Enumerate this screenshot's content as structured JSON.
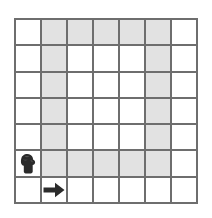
{
  "puzzle": {
    "name": "grid-path-puzzle",
    "grid": {
      "rows": 7,
      "columns": 7,
      "line_color": "#6e6e6e",
      "cell_background": "#ffffff",
      "shaded_color": "#e2e2e2",
      "shaded_cells": [
        [
          0,
          1
        ],
        [
          0,
          2
        ],
        [
          0,
          3
        ],
        [
          0,
          4
        ],
        [
          0,
          5
        ],
        [
          1,
          1
        ],
        [
          1,
          5
        ],
        [
          2,
          1
        ],
        [
          2,
          5
        ],
        [
          3,
          1
        ],
        [
          3,
          5
        ],
        [
          4,
          1
        ],
        [
          4,
          5
        ],
        [
          5,
          1
        ],
        [
          5,
          2
        ],
        [
          5,
          3
        ],
        [
          5,
          4
        ],
        [
          5,
          5
        ]
      ]
    },
    "markers": [
      {
        "icon": "figure-icon",
        "label": "figure",
        "row": 5,
        "column": 0,
        "color": "#2b2b2b"
      },
      {
        "icon": "arrow-right-icon",
        "label": "arrow right",
        "row": 6,
        "column": 1,
        "color": "#2b2b2b"
      }
    ]
  }
}
